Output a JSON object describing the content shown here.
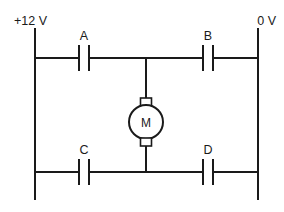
{
  "diagram": {
    "type": "electrical-circuit-schematic",
    "background_color": "#ffffff",
    "line_color": "#1a1a1a"
  },
  "rails": {
    "supply_label": "+12 V",
    "ground_label": "0 V"
  },
  "switches": [
    {
      "id": "A",
      "label": "A",
      "position": "top-left",
      "state": "open"
    },
    {
      "id": "B",
      "label": "B",
      "position": "top-right",
      "state": "open"
    },
    {
      "id": "C",
      "label": "C",
      "position": "bottom-left",
      "state": "open"
    },
    {
      "id": "D",
      "label": "D",
      "position": "bottom-right",
      "state": "open"
    }
  ],
  "motor": {
    "symbol_label": "M",
    "name": "motor"
  },
  "geometry": {
    "left_rail_x": 35,
    "right_rail_x": 258,
    "rail_top_y": 28,
    "rail_bottom_y": 200,
    "top_wire_y": 58,
    "bottom_wire_y": 172,
    "branch_x": 146,
    "motor_center_y": 122,
    "motor_radius": 17
  }
}
